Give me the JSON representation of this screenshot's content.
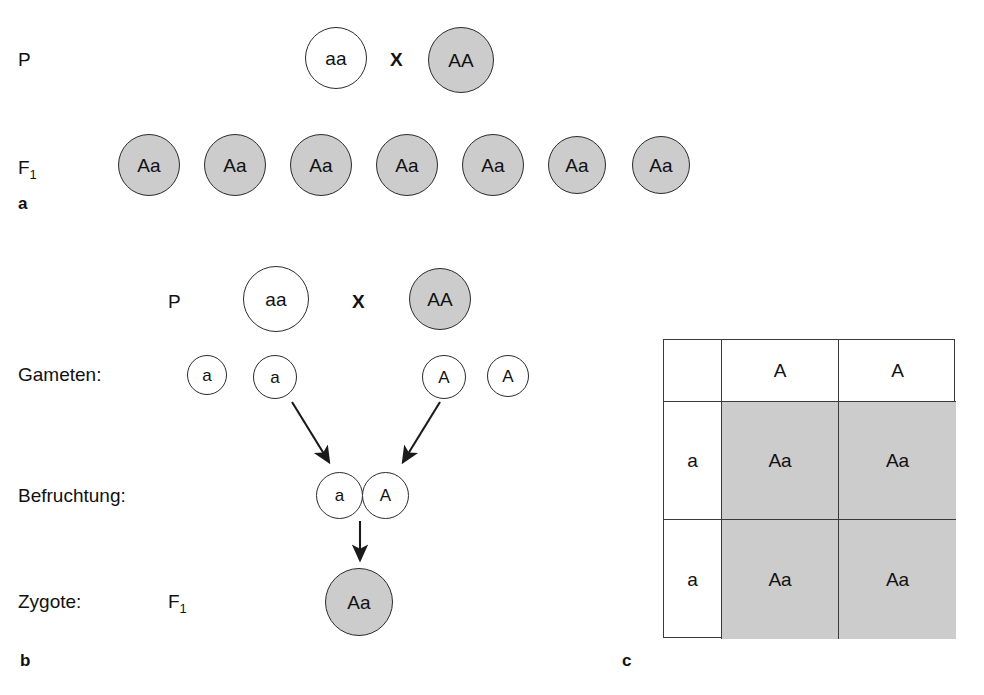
{
  "figure": {
    "caption_language": "German",
    "shaded_color": "#cccccc",
    "line_color": "#2b2b2b",
    "background": "#ffffff"
  },
  "panel_a": {
    "letter": "a",
    "row_p": {
      "label": "P",
      "cross_symbol": "X",
      "parent_left": {
        "genotype": "aa",
        "shaded": false
      },
      "parent_right": {
        "genotype": "AA",
        "shaded": true
      }
    },
    "row_f1": {
      "label_base": "F",
      "label_sub": "1",
      "offspring": [
        {
          "genotype": "Aa",
          "shaded": true
        },
        {
          "genotype": "Aa",
          "shaded": true
        },
        {
          "genotype": "Aa",
          "shaded": true
        },
        {
          "genotype": "Aa",
          "shaded": true
        },
        {
          "genotype": "Aa",
          "shaded": true
        },
        {
          "genotype": "Aa",
          "shaded": true
        },
        {
          "genotype": "Aa",
          "shaded": true
        }
      ]
    }
  },
  "panel_b": {
    "letter": "b",
    "row_p": {
      "label": "P",
      "cross_symbol": "X",
      "parent_left": {
        "genotype": "aa",
        "shaded": false
      },
      "parent_right": {
        "genotype": "AA",
        "shaded": true
      }
    },
    "row_gametes": {
      "label": "Gameten:",
      "left": [
        {
          "allele": "a"
        },
        {
          "allele": "a"
        }
      ],
      "right": [
        {
          "allele": "A"
        },
        {
          "allele": "A"
        }
      ]
    },
    "row_fertilization": {
      "label": "Befruchtung:",
      "gametes": [
        {
          "allele": "a"
        },
        {
          "allele": "A"
        }
      ]
    },
    "row_zygote": {
      "label": "Zygote:",
      "generation_base": "F",
      "generation_sub": "1",
      "zygote": {
        "genotype": "Aa",
        "shaded": true
      }
    }
  },
  "panel_c": {
    "letter": "c",
    "punnett": {
      "corner": "",
      "column_headers": [
        "A",
        "A"
      ],
      "row_headers": [
        "a",
        "a"
      ],
      "cells": [
        [
          "Aa",
          "Aa"
        ],
        [
          "Aa",
          "Aa"
        ]
      ]
    }
  }
}
